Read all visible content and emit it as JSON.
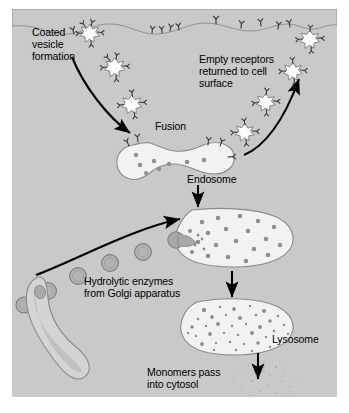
{
  "figure": {
    "domain": "biology-diagram"
  },
  "colors": {
    "cytosol": "#c9c9c9",
    "page_background": "#ffffff",
    "organelle_fill": "#ececec",
    "organelle_stroke": "#8a8a8a",
    "vesicle_fill": "#b3b3b3",
    "vesicle_stroke": "#7d7d7d",
    "granule": "#8f8f8f",
    "coated_vesicle_fill": "#ffffff",
    "receptor": "#3a3a3a",
    "arrow": "#000000",
    "text": "#000000"
  },
  "labels": {
    "coated_vesicle_formation": "Coated\nvesicle\nformation",
    "empty_receptors": "Empty receptors\nreturned to cell\nsurface",
    "fusion": "Fusion",
    "endosome": "Endosome",
    "hydrolytic_enzymes": "Hydrolytic enzymes\nfrom Golgi apparatus",
    "lysosome": "Lysosome",
    "monomers": "Monomers pass\ninto cytosol"
  },
  "structures": [
    {
      "name": "plasma-membrane",
      "description": "Wavy cell surface across the top bearing Y-shaped receptors"
    },
    {
      "name": "coated-vesicle",
      "count": 3,
      "description": "Spiky white clathrin-coated vesicles descending from the membrane"
    },
    {
      "name": "endosome",
      "description": "Peanut-shaped vesicle formed by fusion, containing ligand granules"
    },
    {
      "name": "recycling-vesicle",
      "count": 4,
      "description": "Empty receptor vesicles returning to the cell surface"
    },
    {
      "name": "endolysosome",
      "description": "Large oval organelle receiving hydrolytic enzymes"
    },
    {
      "name": "golgi-apparatus",
      "description": "Elongated S-shaped sac at lower left budding enzyme vesicles"
    },
    {
      "name": "enzyme-vesicle",
      "count": 5,
      "description": "Gray round vesicles carrying hydrolytic enzymes from the Golgi"
    },
    {
      "name": "lysosome",
      "description": "Oval organelle densely filled with digested monomer particles"
    },
    {
      "name": "monomer-cloud",
      "description": "Fine scatter of monomers released into the cytosol"
    }
  ],
  "arrows": [
    {
      "name": "endocytosis-arrow",
      "from": "cell surface",
      "to": "endosome"
    },
    {
      "name": "recycling-arrow",
      "from": "endosome region",
      "to": "cell surface"
    },
    {
      "name": "endosome-to-endolysosome-arrow",
      "from": "endosome",
      "to": "endolysosome"
    },
    {
      "name": "golgi-to-endolysosome-arrow",
      "from": "Golgi apparatus",
      "to": "endolysosome"
    },
    {
      "name": "endolysosome-to-lysosome-arrow",
      "from": "endolysosome",
      "to": "lysosome"
    },
    {
      "name": "monomer-release-arrow",
      "from": "lysosome",
      "to": "cytosol"
    }
  ]
}
